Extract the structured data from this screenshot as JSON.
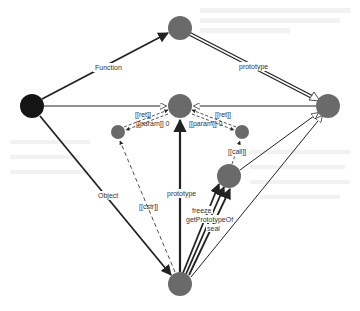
{
  "diagram": {
    "nodes": [
      {
        "id": "function-prototype",
        "x": 180,
        "y": 28,
        "r": 12,
        "color": "#6a6a6a"
      },
      {
        "id": "global",
        "x": 32,
        "y": 106,
        "r": 12,
        "color": "#151515"
      },
      {
        "id": "function-instance",
        "x": 180,
        "y": 106,
        "r": 12,
        "color": "#6a6a6a"
      },
      {
        "id": "object-prototype",
        "x": 328,
        "y": 106,
        "r": 12,
        "color": "#6a6a6a"
      },
      {
        "id": "param-left",
        "x": 118,
        "y": 132,
        "r": 7,
        "color": "#6a6a6a"
      },
      {
        "id": "param-right",
        "x": 242,
        "y": 132,
        "r": 7,
        "color": "#6a6a6a"
      },
      {
        "id": "call-node",
        "x": 229,
        "y": 176,
        "r": 12,
        "color": "#6a6a6a"
      },
      {
        "id": "object-constructor",
        "x": 180,
        "y": 284,
        "r": 12,
        "color": "#6a6a6a"
      }
    ],
    "labels": {
      "function": "Function",
      "prototype_top": "prototype",
      "ret_left": "[[ret]]",
      "param_left": "[[param]] 0",
      "ret_right": "[[ret]]",
      "param_right": "[[param]] 0",
      "call": "[[call]]",
      "object": "Object",
      "cstr": "[[cstr]]",
      "prototype_bottom": "prototype",
      "freeze": "freeze",
      "getPrototypeOf": "getPrototypeOf",
      "seal": "seal"
    },
    "colors": {
      "edge": "#222222",
      "node_gray": "#6a6a6a",
      "node_dark": "#151515",
      "label": "#333333"
    }
  }
}
